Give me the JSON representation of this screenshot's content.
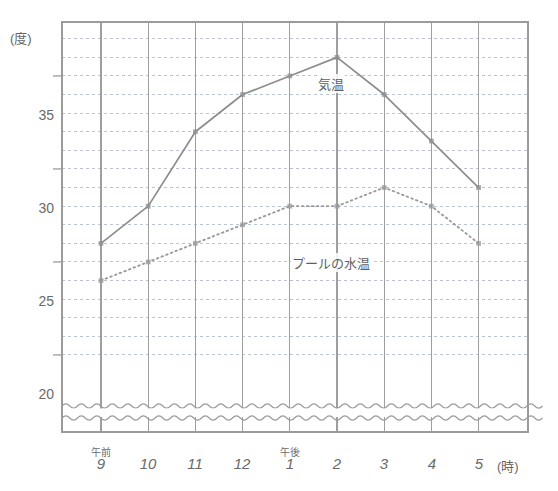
{
  "chart_data": {
    "type": "line",
    "title": "",
    "xlabel": "(時)",
    "ylabel": "(度)",
    "grid": true,
    "legend_position": "inline-annotation",
    "axis_break": true,
    "ylim": [
      18,
      38
    ],
    "yticks": [
      20,
      25,
      30,
      35
    ],
    "ytick_labels": [
      "20",
      "25",
      "30",
      "35"
    ],
    "x": [
      "9",
      "10",
      "11",
      "12",
      "1",
      "2",
      "3",
      "4",
      "5"
    ],
    "xtick_prefixes": [
      "午前",
      "",
      "",
      "",
      "午後",
      "",
      "",
      "",
      ""
    ],
    "categories": [
      "午前9",
      "10",
      "11",
      "12",
      "午後1",
      "2",
      "3",
      "4",
      "5"
    ],
    "series": [
      {
        "name": "気温",
        "style": "solid",
        "color": "#8d8d8d",
        "values": [
          26,
          28,
          32,
          34,
          35,
          36,
          34,
          31.5,
          29
        ]
      },
      {
        "name": "プールの水温",
        "style": "dotted",
        "color": "#9a9a9a",
        "values": [
          24,
          25,
          26,
          27,
          28,
          28,
          29,
          28,
          26
        ]
      }
    ],
    "annotations": [
      {
        "text": "気温",
        "x": "2",
        "y": 36
      },
      {
        "text": "プールの水温",
        "x": "2",
        "y": 27.3
      }
    ]
  },
  "axes": {
    "y_unit": "(度)",
    "x_unit": "(時)",
    "y_tick_values": [
      "35",
      "30",
      "25",
      "20"
    ],
    "x_tick_values": [
      "9",
      "10",
      "11",
      "12",
      "1",
      "2",
      "3",
      "4",
      "5"
    ],
    "x_tick_prefixes": [
      "午前",
      "",
      "",
      "",
      "午後",
      "",
      "",
      "",
      ""
    ]
  },
  "labels": {
    "air_temp": "気温",
    "water_temp": "プールの水温"
  },
  "colors": {
    "frame": "#9b9b9b",
    "gridline_major": "#9e9e9e",
    "gridline_minor": "#b9c4d6",
    "air_temp_line": "#8d8d8d",
    "water_temp_line": "#9a9a9a",
    "text": "#6a6a6a",
    "background": "#ffffff"
  }
}
